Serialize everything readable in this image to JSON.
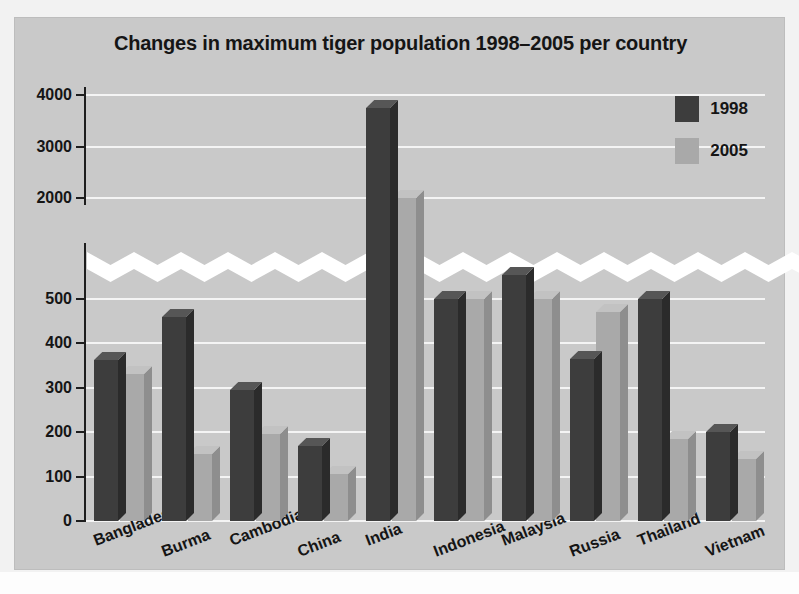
{
  "chart_data": {
    "type": "bar",
    "title": "Changes in maximum tiger population 1998–2005 per country",
    "xlabel": "",
    "ylabel": "",
    "grid": true,
    "legend_position": "top-right",
    "axis_break": {
      "present": true,
      "between": [
        500,
        2000
      ],
      "style": "white-zigzag-band"
    },
    "y_lower_ticks": [
      0,
      100,
      200,
      300,
      400,
      500
    ],
    "y_upper_ticks": [
      2000,
      3000,
      4000
    ],
    "ylim_lower": [
      0,
      500
    ],
    "ylim_upper": [
      2000,
      4000
    ],
    "categories": [
      "Bangladesh",
      "Burma",
      "Cambodia",
      "China",
      "India",
      "Indonesia",
      "Malaysia",
      "Russia",
      "Thailand",
      "Vietnam"
    ],
    "series": [
      {
        "name": "1998",
        "color": "#3d3d3d",
        "values": [
          362,
          460,
          295,
          170,
          3750,
          500,
          505,
          365,
          500,
          200
        ]
      },
      {
        "name": "2005",
        "color": "#a9a9a9",
        "values": [
          330,
          150,
          195,
          105,
          2000,
          500,
          500,
          470,
          185,
          140
        ]
      }
    ]
  },
  "legend": {
    "items": [
      {
        "label": "1998",
        "color": "#3d3d3d"
      },
      {
        "label": "2005",
        "color": "#a9a9a9"
      }
    ]
  }
}
